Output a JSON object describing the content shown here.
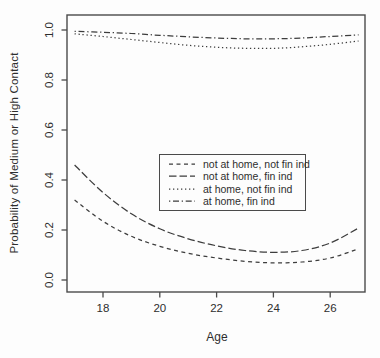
{
  "colors": {
    "curve": "#3d3d3d",
    "axis": "#4a4a4a",
    "text": "#2e2e2e",
    "background": "#fdfdfd"
  },
  "chart_data": {
    "type": "line",
    "title": "",
    "xlabel": "Age",
    "ylabel": "Probability of Medium or High Contact",
    "xlim": [
      16.7,
      27.3
    ],
    "ylim": [
      -0.05,
      1.06
    ],
    "grid": false,
    "x_ticks": [
      {
        "value": 18,
        "label": "18"
      },
      {
        "value": 20,
        "label": "20"
      },
      {
        "value": 22,
        "label": "22"
      },
      {
        "value": 24,
        "label": "24"
      },
      {
        "value": 26,
        "label": "26"
      }
    ],
    "y_ticks": [
      {
        "value": 0.0,
        "label": "0.0"
      },
      {
        "value": 0.2,
        "label": "0.2"
      },
      {
        "value": 0.4,
        "label": "0.4"
      },
      {
        "value": 0.6,
        "label": "0.6"
      },
      {
        "value": 0.8,
        "label": "0.8"
      },
      {
        "value": 1.0,
        "label": "1.0"
      }
    ],
    "x": [
      17,
      18,
      19,
      20,
      21,
      22,
      23,
      24,
      25,
      26,
      27
    ],
    "series": [
      {
        "name": "not at home, not fin ind",
        "linestyle": "dashed",
        "dash": "4 3.5",
        "values": [
          0.32,
          0.235,
          0.175,
          0.135,
          0.107,
          0.088,
          0.075,
          0.069,
          0.072,
          0.088,
          0.125
        ]
      },
      {
        "name": "not at home, fin ind",
        "linestyle": "longdash",
        "dash": "7.5 3",
        "values": [
          0.46,
          0.35,
          0.265,
          0.205,
          0.165,
          0.137,
          0.118,
          0.111,
          0.118,
          0.148,
          0.208
        ]
      },
      {
        "name": "at home, not fin ind",
        "linestyle": "dotted",
        "dash": "1.3 2.7",
        "values": [
          0.985,
          0.974,
          0.962,
          0.95,
          0.939,
          0.931,
          0.927,
          0.927,
          0.933,
          0.943,
          0.956
        ]
      },
      {
        "name": "at home, fin ind",
        "linestyle": "dotdash",
        "dash": "1.3 2.7 6 2.7",
        "values": [
          0.995,
          0.991,
          0.986,
          0.979,
          0.973,
          0.968,
          0.965,
          0.965,
          0.968,
          0.974,
          0.981
        ]
      }
    ],
    "legend_position": "center"
  }
}
